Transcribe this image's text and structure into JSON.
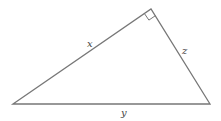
{
  "diagram": {
    "type": "right-triangle",
    "stroke_color": "#777777",
    "labels": {
      "x": "x",
      "y": "y",
      "z": "z"
    },
    "vertices": {
      "left": [
        13,
        104
      ],
      "apex": [
        151,
        9
      ],
      "right": [
        210,
        104
      ]
    },
    "right_angle_at": "apex"
  }
}
